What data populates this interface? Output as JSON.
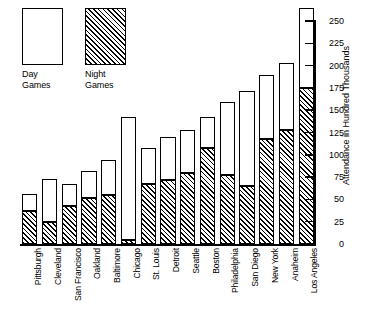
{
  "legend": {
    "items": [
      {
        "name": "day-games",
        "label": "Day\nGames",
        "pattern": "solid-white"
      },
      {
        "name": "night-games",
        "label": "Night\nGames",
        "pattern": "diagonal-hatch"
      }
    ]
  },
  "axis": {
    "y_label": "Attendance in Hundred Thousands",
    "y_ticks": [
      "0",
      "25",
      "50",
      "75",
      "100",
      "125",
      "150",
      "175",
      "200",
      "225",
      "250"
    ]
  },
  "colors": {
    "ink": "#000000",
    "background": "#ffffff",
    "day_fill": "#ffffff",
    "night_fill": "#ffffff",
    "hatch_stroke": "#000000"
  },
  "chart_data": {
    "type": "bar",
    "stacked": true,
    "title": "",
    "xlabel": "",
    "ylabel": "Attendance in Hundred Thousands",
    "ylim": [
      0,
      250
    ],
    "ytick_step": 25,
    "grid": false,
    "legend_position": "top-left",
    "categories": [
      "Pittsburgh",
      "Cleveland",
      "San Francisco",
      "Oakland",
      "Baltimore",
      "Chicago",
      "St. Louis",
      "Detroit",
      "Seattle",
      "Boston",
      "Philadelphia",
      "San Diego",
      "New York",
      "Anaheim",
      "Los Angeles"
    ],
    "series": [
      {
        "name": "Night Games",
        "pattern": "diagonal-hatch",
        "values": [
          37,
          25,
          43,
          52,
          55,
          5,
          68,
          72,
          80,
          108,
          78,
          66,
          118,
          128,
          175
        ]
      },
      {
        "name": "Day Games",
        "pattern": "solid-white",
        "values": [
          20,
          48,
          25,
          30,
          40,
          138,
          40,
          48,
          48,
          35,
          82,
          106,
          72,
          75,
          90
        ]
      }
    ],
    "totals": [
      57,
      73,
      68,
      82,
      95,
      143,
      108,
      120,
      128,
      143,
      160,
      172,
      190,
      203,
      265
    ]
  }
}
